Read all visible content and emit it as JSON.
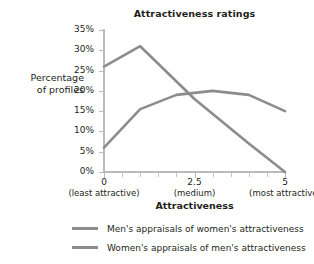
{
  "chart_data": {
    "type": "line",
    "title": "Attractiveness ratings",
    "xlabel": "Attractiveness",
    "ylabel": "Percentage\nof profiles",
    "ylabel_lines": [
      "Percentage",
      "of profiles"
    ],
    "xlim": [
      0,
      5
    ],
    "ylim": [
      0,
      35
    ],
    "grid": false,
    "legend_position": "bottom",
    "x": [
      0,
      1,
      2,
      2.5,
      3,
      4,
      5
    ],
    "y_tick_labels": [
      "0%",
      "5%",
      "10%",
      "15%",
      "20%",
      "25%",
      "30%",
      "35%"
    ],
    "y_tick_values": [
      0,
      5,
      10,
      15,
      20,
      25,
      30,
      35
    ],
    "x_tick_labels": [
      "0",
      "2.5",
      "5"
    ],
    "x_tick_values": [
      0,
      2.5,
      5
    ],
    "x_tick_sublabels": [
      "(least attractive)",
      "(medium)",
      "(most attractive)"
    ],
    "x_minor_tick_values": [
      0.5,
      1,
      1.5,
      2,
      3,
      3.5,
      4,
      4.5
    ],
    "series": [
      {
        "name": "Men's appraisals of women's attractiveness",
        "color": "#8c8c8c",
        "x": [
          0,
          1,
          2.5,
          4,
          5
        ],
        "values": [
          26,
          31,
          18,
          7,
          0
        ]
      },
      {
        "name": "Women's appraisals of men's attractiveness",
        "color": "#8c8c8c",
        "x": [
          0,
          1,
          2,
          3,
          4,
          5
        ],
        "values": [
          6,
          15.5,
          19,
          20,
          19,
          15
        ]
      }
    ]
  },
  "legend": {
    "items": [
      {
        "label": "Men's appraisals of women's attractiveness",
        "color": "#8c8c8c"
      },
      {
        "label": "Women's appraisals of men's attractiveness",
        "color": "#8c8c8c"
      }
    ]
  },
  "style": {
    "axis_color": "#b9b9b9",
    "line_color": "#8c8c8c",
    "text_color": "#231f20",
    "background": "#ffffff"
  }
}
